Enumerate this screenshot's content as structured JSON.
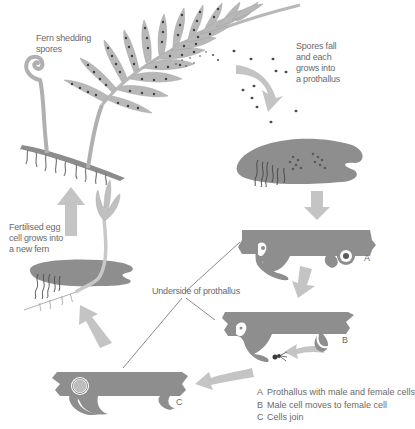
{
  "diagram": {
    "type": "life-cycle",
    "colors": {
      "background": "#ffffff",
      "plant": "#a8a8a8",
      "prothallus": "#8e8e8e",
      "arrow": "#c4c4c4",
      "spore": "#4a4a4a",
      "text": "#6a6a6a"
    },
    "labels": {
      "fern_shedding": [
        "Fern shedding",
        "spores"
      ],
      "spores_fall": [
        "Spores fall",
        "and each",
        "grows into",
        "a prothallus"
      ],
      "fertilised": [
        "Fertilised egg",
        "cell grows into",
        "a new fern"
      ],
      "underside": "Underside of prothallus",
      "stage_a": "A",
      "stage_b": "B",
      "stage_c": "C"
    },
    "legend": [
      {
        "key": "A",
        "text": "Prothallus with male and female cells"
      },
      {
        "key": "B",
        "text": "Male cell moves to female cell"
      },
      {
        "key": "C",
        "text": "Cells join"
      }
    ],
    "stages": [
      {
        "id": "fern",
        "name": "Mature fern shedding spores"
      },
      {
        "id": "spores",
        "name": "Spores fall"
      },
      {
        "id": "prothallus",
        "name": "Prothallus (top view)"
      },
      {
        "id": "A",
        "name": "Prothallus underside with male and female cells"
      },
      {
        "id": "B",
        "name": "Male cell moves to female cell"
      },
      {
        "id": "C",
        "name": "Cells join"
      },
      {
        "id": "young",
        "name": "Young fern growing from prothallus"
      }
    ]
  }
}
